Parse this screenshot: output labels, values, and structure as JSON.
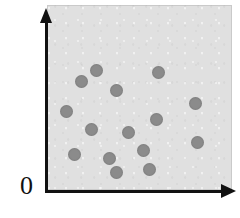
{
  "figure": {
    "origin_label": "0",
    "panel_color": "#e0e0e0",
    "axis_color": "#111111",
    "point_color": "#8b8b8b",
    "background_color": "#ffffff"
  },
  "axes": {
    "y_axis_name": "vertical-axis",
    "x_axis_name": "horizontal-axis",
    "y_arrow": "arrow-up-icon",
    "x_arrow": "arrow-right-icon"
  },
  "chart_data": {
    "type": "scatter",
    "title": "",
    "subtitle": "",
    "xlabel": "",
    "ylabel": "",
    "xlim": [
      0,
      100
    ],
    "ylim": [
      0,
      100
    ],
    "xticks": [],
    "yticks": [],
    "grid": false,
    "legend": null,
    "annotations": [
      "0"
    ],
    "n_points": 15,
    "marker": "circle",
    "marker_color": "#8b8b8b",
    "marker_size_px": 13,
    "series": [
      {
        "name": "points",
        "points": [
          {
            "x": 34,
            "y": 73
          },
          {
            "x": 26,
            "y": 67
          },
          {
            "x": 47,
            "y": 62
          },
          {
            "x": 70,
            "y": 72
          },
          {
            "x": 12,
            "y": 50
          },
          {
            "x": 85,
            "y": 53
          },
          {
            "x": 65,
            "y": 45
          },
          {
            "x": 31,
            "y": 36
          },
          {
            "x": 51,
            "y": 34
          },
          {
            "x": 86,
            "y": 28
          },
          {
            "x": 19,
            "y": 21
          },
          {
            "x": 38,
            "y": 19
          },
          {
            "x": 57,
            "y": 24
          },
          {
            "x": 72,
            "y": 6
          },
          {
            "x": 90,
            "y": 9
          }
        ]
      }
    ]
  },
  "points_px": [
    {
      "left": 90,
      "top": 64
    },
    {
      "left": 75,
      "top": 75
    },
    {
      "left": 110,
      "top": 84
    },
    {
      "left": 152,
      "top": 66
    },
    {
      "left": 60,
      "top": 105
    },
    {
      "left": 189,
      "top": 97
    },
    {
      "left": 150,
      "top": 113
    },
    {
      "left": 85,
      "top": 123
    },
    {
      "left": 122,
      "top": 126
    },
    {
      "left": 191,
      "top": 136
    },
    {
      "left": 68,
      "top": 148
    },
    {
      "left": 103,
      "top": 152
    },
    {
      "left": 137,
      "top": 144
    },
    {
      "left": 110,
      "top": 166
    },
    {
      "left": 143,
      "top": 163
    }
  ]
}
